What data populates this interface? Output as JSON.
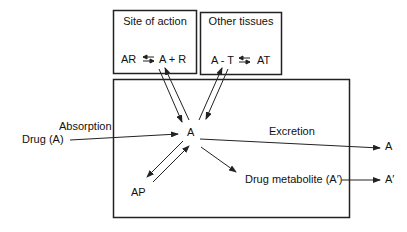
{
  "boxes": {
    "site_of_action": {
      "title": "Site of action",
      "left": "AR",
      "right": "A + R"
    },
    "other_tissues": {
      "title": "Other tissues",
      "left": "A - T",
      "right": "AT"
    }
  },
  "labels": {
    "drug": "Drug (A)",
    "absorption": "Absorption",
    "center": "A",
    "excretion": "Excretion",
    "excreted": "A",
    "ap": "AP",
    "metabolite": "Drug metabolite (A′)",
    "metabolite_excreted": "A′"
  },
  "colors": {
    "line": "#222222",
    "background": "#ffffff"
  }
}
